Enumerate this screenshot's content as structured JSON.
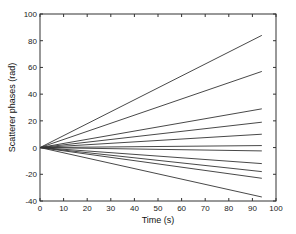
{
  "chart_data": {
    "type": "line",
    "title": "",
    "xlabel": "Time (s)",
    "ylabel": "Scatterer phases (rad)",
    "xlim": [
      0,
      100
    ],
    "ylim": [
      -40,
      100
    ],
    "xticks": [
      0,
      10,
      20,
      30,
      40,
      50,
      60,
      70,
      80,
      90,
      100
    ],
    "yticks": [
      -40,
      -20,
      0,
      20,
      40,
      60,
      80,
      100
    ],
    "grid": false,
    "legend": null,
    "x": [
      0,
      94
    ],
    "series": [
      {
        "name": "scatterer 1",
        "values": [
          0,
          84
        ]
      },
      {
        "name": "scatterer 2",
        "values": [
          0,
          57
        ]
      },
      {
        "name": "scatterer 3",
        "values": [
          0,
          29
        ]
      },
      {
        "name": "scatterer 4",
        "values": [
          0,
          19
        ]
      },
      {
        "name": "scatterer 5",
        "values": [
          0,
          10
        ]
      },
      {
        "name": "scatterer 6",
        "values": [
          0,
          1.5
        ]
      },
      {
        "name": "scatterer 7",
        "values": [
          0,
          -2.5
        ]
      },
      {
        "name": "scatterer 8",
        "values": [
          0,
          -12
        ]
      },
      {
        "name": "scatterer 9",
        "values": [
          0,
          -18
        ]
      },
      {
        "name": "scatterer 10",
        "values": [
          0,
          -23
        ]
      },
      {
        "name": "scatterer 11",
        "values": [
          0,
          -37
        ]
      }
    ],
    "line_color": "#333333"
  }
}
